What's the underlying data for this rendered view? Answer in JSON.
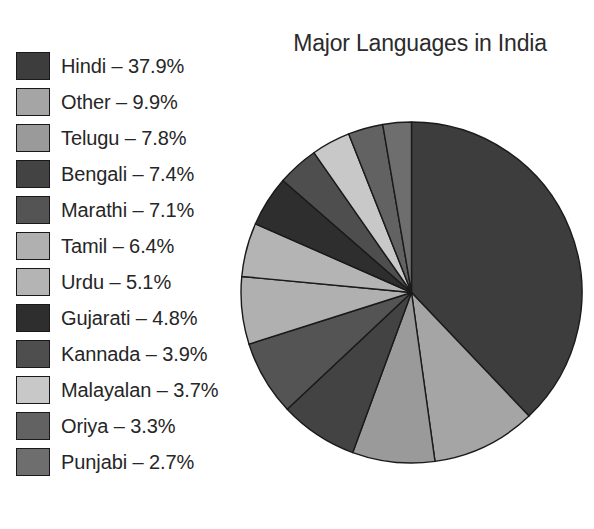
{
  "title": "Major Languages in India",
  "legend": {
    "items": [
      {
        "label": "Hindi – 37.9%",
        "name": "Hindi",
        "value": 37.9,
        "color": "#3d3d3d"
      },
      {
        "label": "Other – 9.9%",
        "name": "Other",
        "value": 9.9,
        "color": "#a5a5a5"
      },
      {
        "label": "Telugu – 7.8%",
        "name": "Telugu",
        "value": 7.8,
        "color": "#9a9a9a"
      },
      {
        "label": "Bengali – 7.4%",
        "name": "Bengali",
        "value": 7.4,
        "color": "#434343"
      },
      {
        "label": "Marathi – 7.1%",
        "name": "Marathi",
        "value": 7.1,
        "color": "#545454"
      },
      {
        "label": "Tamil – 6.4%",
        "name": "Tamil",
        "value": 6.4,
        "color": "#b0b0b0"
      },
      {
        "label": "Urdu – 5.1%",
        "name": "Urdu",
        "value": 5.1,
        "color": "#b4b4b4"
      },
      {
        "label": "Gujarati – 4.8%",
        "name": "Gujarati",
        "value": 4.8,
        "color": "#2e2e2e"
      },
      {
        "label": "Kannada – 3.9%",
        "name": "Kannada",
        "value": 3.9,
        "color": "#4e4e4e"
      },
      {
        "label": "Malayalan – 3.7%",
        "name": "Malayalan",
        "value": 3.7,
        "color": "#c8c8c8"
      },
      {
        "label": "Oriya – 3.3%",
        "name": "Oriya",
        "value": 3.3,
        "color": "#626262"
      },
      {
        "label": "Punjabi – 2.7%",
        "name": "Punjabi",
        "value": 2.7,
        "color": "#6e6e6e"
      }
    ]
  },
  "chart_data": {
    "type": "pie",
    "title": "Major Languages in India",
    "unit": "percent",
    "start_angle_deg": 0,
    "direction": "clockwise",
    "legend_position": "left",
    "grid": false,
    "labels": [
      "Hindi",
      "Other",
      "Telugu",
      "Bengali",
      "Marathi",
      "Tamil",
      "Urdu",
      "Gujarati",
      "Kannada",
      "Malayalan",
      "Oriya",
      "Punjabi"
    ],
    "values": [
      37.9,
      9.9,
      7.8,
      7.4,
      7.1,
      6.4,
      5.1,
      4.8,
      3.9,
      3.7,
      3.3,
      2.7
    ],
    "colors": [
      "#3d3d3d",
      "#a5a5a5",
      "#9a9a9a",
      "#434343",
      "#545454",
      "#b0b0b0",
      "#b4b4b4",
      "#2e2e2e",
      "#4e4e4e",
      "#c8c8c8",
      "#626262",
      "#6e6e6e"
    ],
    "slice_labels": [
      "Hindi – 37.9%",
      "Other – 9.9%",
      "Telugu – 7.8%",
      "Bengali – 7.4%",
      "Marathi – 7.1%",
      "Tamil – 6.4%",
      "Urdu – 5.1%",
      "Gujarati – 4.8%",
      "Kannada – 3.9%",
      "Malayalan – 3.7%",
      "Oriya – 3.3%",
      "Punjabi – 2.7%"
    ],
    "total": 100.0,
    "stroke_color": "#1a1a1a"
  }
}
